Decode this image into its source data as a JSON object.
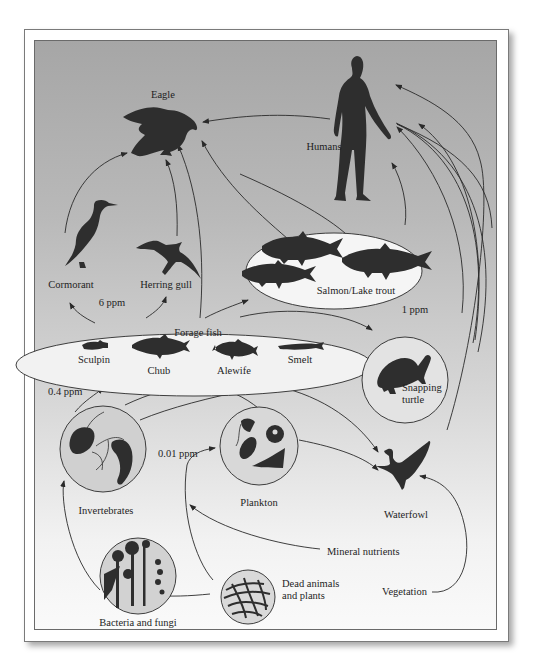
{
  "diagram": {
    "type": "food-web-biomagnification",
    "nodes": {
      "eagle": "Eagle",
      "humans": "Humans",
      "cormorant": "Cormorant",
      "herring_gull": "Herring gull",
      "salmon_lake_trout": "Salmon/Lake trout",
      "forage_fish": "Forage fish",
      "sculpin": "Sculpin",
      "chub": "Chub",
      "alewife": "Alewife",
      "smelt": "Smelt",
      "snapping_turtle": "Snapping turtle",
      "snapping_line1": "Snapping",
      "snapping_line2": "turtle",
      "invertebrates": "Invertebrates",
      "plankton": "Plankton",
      "waterfowl": "Waterfowl",
      "mineral_nutrients": "Mineral nutrients",
      "dead_line1": "Dead animals",
      "dead_line2": "and plants",
      "bacteria_fungi": "Bacteria and fungi",
      "vegetation": "Vegetation"
    },
    "concentrations": {
      "gulls_cormorant": "6 ppm",
      "salmon_turtle": "1 ppm",
      "forage_fish": "0.4 ppm",
      "plankton": "0.01 ppm"
    },
    "colors": {
      "silhouette": "#2e2e2e",
      "line": "#2a2a2a",
      "ellipse_fill": "#f4f4f4",
      "circle_fill": "#d9d9d9",
      "panel_top": "#a6a6a6",
      "panel_bottom": "#fafafa"
    },
    "edges": [
      [
        "Cormorant",
        "Eagle"
      ],
      [
        "Herring gull",
        "Eagle"
      ],
      [
        "Forage fish",
        "Eagle"
      ],
      [
        "Salmon/Lake trout",
        "Eagle"
      ],
      [
        "Humans",
        "Eagle"
      ],
      [
        "Forage fish",
        "Cormorant"
      ],
      [
        "Forage fish",
        "Herring gull"
      ],
      [
        "Forage fish",
        "Salmon/Lake trout"
      ],
      [
        "Forage fish",
        "Snapping turtle"
      ],
      [
        "Salmon/Lake trout",
        "Humans"
      ],
      [
        "Forage fish",
        "Humans"
      ],
      [
        "Snapping turtle",
        "Humans"
      ],
      [
        "Waterfowl",
        "Humans"
      ],
      [
        "Invertebrates",
        "Forage fish"
      ],
      [
        "Invertebrates",
        "Snapping turtle"
      ],
      [
        "Invertebrates",
        "Waterfowl"
      ],
      [
        "Plankton",
        "Forage fish"
      ],
      [
        "Plankton",
        "Waterfowl"
      ],
      [
        "Bacteria and fungi",
        "Invertebrates"
      ],
      [
        "Dead animals and plants",
        "Bacteria and fungi"
      ],
      [
        "Dead animals and plants",
        "Plankton"
      ],
      [
        "Mineral nutrients",
        "Plankton"
      ],
      [
        "Vegetation",
        "Waterfowl"
      ]
    ]
  }
}
